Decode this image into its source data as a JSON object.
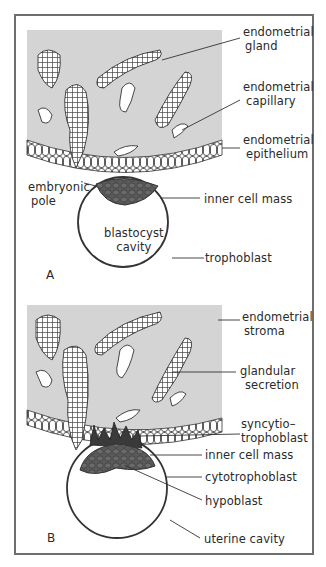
{
  "figure": {
    "panels": [
      {
        "id": "A",
        "letter": "A",
        "labels": {
          "endometrial_gland": [
            "endometrial",
            "gland"
          ],
          "endometrial_capillary": [
            "endometrial",
            "capillary"
          ],
          "endometrial_epithelium": [
            "endometrial",
            "epithelium"
          ],
          "embryonic_pole": [
            "embryonic",
            "pole"
          ],
          "inner_cell_mass": "inner cell mass",
          "blastocyst_cavity": [
            "blastocyst",
            "cavity"
          ],
          "trophoblast": "trophoblast"
        }
      },
      {
        "id": "B",
        "letter": "B",
        "labels": {
          "endometrial_stroma": [
            "endometrial",
            "stroma"
          ],
          "glandular_secretion": [
            "glandular",
            "secretion"
          ],
          "syncytiotrophoblast": [
            "syncytio–",
            "trophoblast"
          ],
          "inner_cell_mass": "inner cell mass",
          "cytotrophoblast": "cytotrophoblast",
          "hypoblast": "hypoblast",
          "uterine_cavity": "uterine cavity"
        }
      }
    ],
    "colors": {
      "stroma": "#d4d4d4",
      "inner_cell_mass": "#5a5a5a",
      "syncytiotrophoblast": "#3a3a3a",
      "line": "#2a2a2a",
      "frame": "#6e6e6e"
    }
  }
}
